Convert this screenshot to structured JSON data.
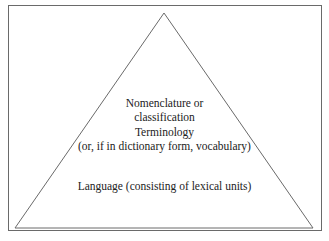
{
  "diagram": {
    "type": "pyramid",
    "levels": [
      {
        "line1": "Nomenclature or",
        "line2": "classification"
      },
      {
        "line1": "Terminology",
        "line2": "(or, if in dictionary form, vocabulary)"
      },
      {
        "line1": "Language (consisting of lexical units)"
      }
    ],
    "colors": {
      "stroke": "#6a6a6a",
      "text": "#222222",
      "background": "#ffffff"
    }
  }
}
